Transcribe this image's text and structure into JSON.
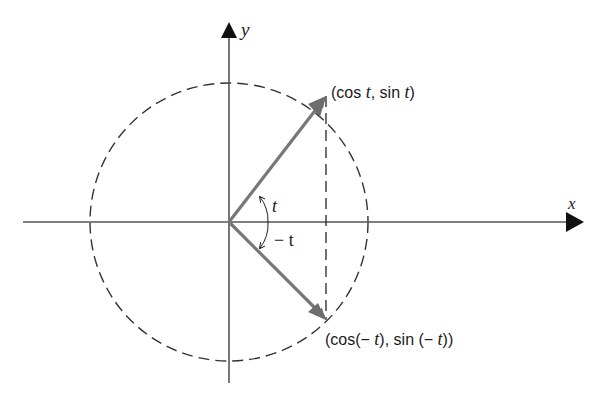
{
  "diagram": {
    "type": "unit-circle-symmetry",
    "axes": {
      "x_label": "x",
      "y_label": "y"
    },
    "circle": {
      "style": "dashed",
      "center": [
        229,
        222
      ],
      "radius": 139
    },
    "vectors": [
      {
        "name": "angle t",
        "to_label": "(cos t, sin t)"
      },
      {
        "name": "angle -t",
        "to_label": "(cos(− t), sin (− t))"
      }
    ],
    "angle_labels": {
      "positive": "t",
      "negative": "− t"
    },
    "labels": {
      "upper_point": {
        "open": "(cos ",
        "t1": "t",
        "mid": ", sin ",
        "t2": "t",
        "close": ")"
      },
      "lower_point": {
        "open": "(cos(− ",
        "t1": "t",
        "mid": "), sin (− ",
        "t2": "t",
        "close": "))"
      }
    },
    "colors": {
      "axis": "#555555",
      "vector": "#777777",
      "arrowhead": "#111111",
      "dashed": "#333333"
    }
  }
}
